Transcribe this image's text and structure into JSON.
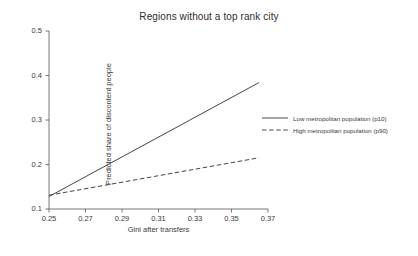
{
  "chart_data": {
    "type": "line",
    "title": "Regions without a top rank city",
    "xlabel": "Gini after transfers",
    "ylabel": "Predicted share of discontent people",
    "xlim": [
      0.25,
      0.37
    ],
    "ylim": [
      0.1,
      0.5
    ],
    "xticks": [
      "0.25",
      "0.27",
      "0.29",
      "0.31",
      "0.33",
      "0.35",
      "0.37"
    ],
    "xtick_values": [
      0.25,
      0.27,
      0.29,
      0.31,
      0.33,
      0.35,
      0.37
    ],
    "yticks": [
      "0.1",
      "0.2",
      "0.3",
      "0.4",
      "0.5"
    ],
    "ytick_values": [
      0.1,
      0.2,
      0.3,
      0.4,
      0.5
    ],
    "grid": false,
    "legend_position": "right",
    "series": [
      {
        "name": "Low metropolitan population (p10)",
        "style": "solid",
        "color": "#3a3a3a",
        "x": [
          0.25,
          0.365
        ],
        "values": [
          0.128,
          0.384
        ]
      },
      {
        "name": "High metropolitan population (p90)",
        "style": "dashed",
        "color": "#3a3a3a",
        "x": [
          0.25,
          0.365
        ],
        "values": [
          0.131,
          0.215
        ]
      }
    ]
  },
  "legend": {
    "items": [
      {
        "label": "Low metropolitan population (p10)"
      },
      {
        "label": "High metropolitan population (p90)"
      }
    ]
  }
}
